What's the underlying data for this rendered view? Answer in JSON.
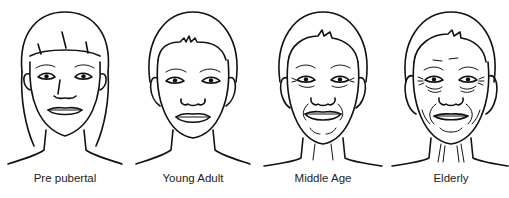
{
  "figure": {
    "panels": [
      {
        "id": "pre-pubertal",
        "label": "Pre pubertal",
        "center_x": 65
      },
      {
        "id": "young-adult",
        "label": "Young Adult",
        "center_x": 193
      },
      {
        "id": "middle-age",
        "label": "Middle Age",
        "center_x": 323
      },
      {
        "id": "elderly",
        "label": "Elderly",
        "center_x": 451
      }
    ],
    "colors": {
      "line": "#111111",
      "background": "#ffffff",
      "text": "#222222"
    }
  }
}
